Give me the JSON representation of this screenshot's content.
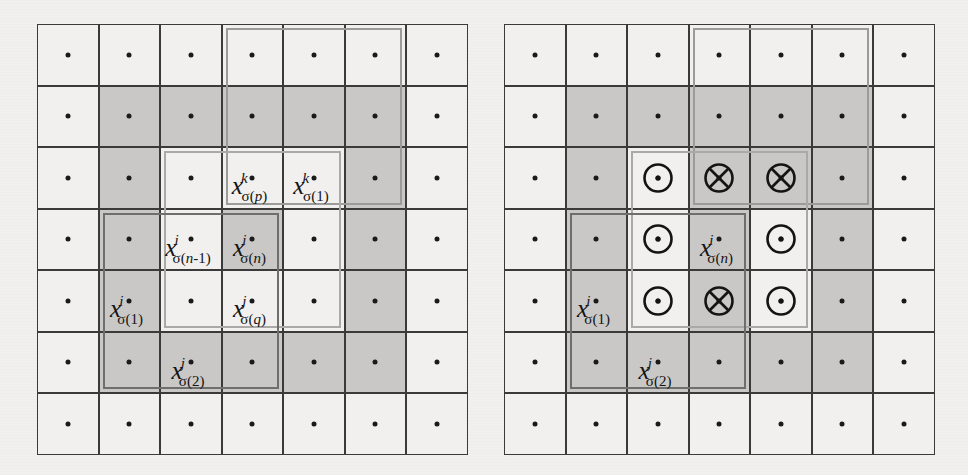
{
  "figure": {
    "grid": {
      "rows": 7,
      "cols": 7,
      "cell_size_px": 61.5
    },
    "colors": {
      "paper": "#f1f0ee",
      "cell_shaded": "#c9c8c6",
      "grid_line": "#3a3a3a",
      "overlay_k": "#9b9b99",
      "overlay_j": "#a9a9a7",
      "overlay_i": "#6e6e6c",
      "ink": "#141414"
    }
  },
  "panels": [
    {
      "id": "left",
      "name": "left-lattice-panel",
      "shaded_cells": [
        [
          2,
          2
        ],
        [
          2,
          3
        ],
        [
          2,
          4
        ],
        [
          2,
          5
        ],
        [
          2,
          6
        ],
        [
          3,
          2
        ],
        [
          3,
          6
        ],
        [
          4,
          2
        ],
        [
          4,
          4
        ],
        [
          4,
          6
        ],
        [
          5,
          2
        ],
        [
          5,
          6
        ],
        [
          6,
          2
        ],
        [
          6,
          3
        ],
        [
          6,
          4
        ],
        [
          6,
          5
        ],
        [
          6,
          6
        ]
      ],
      "overlays": [
        {
          "kind": "k",
          "name": "overlay-rect-k",
          "row_start": 1,
          "row_end": 3,
          "col_start": 4,
          "col_end": 6
        },
        {
          "kind": "j",
          "name": "overlay-rect-j",
          "row_start": 3,
          "row_end": 5,
          "col_start": 3,
          "col_end": 5
        },
        {
          "kind": "i",
          "name": "overlay-rect-i",
          "row_start": 4,
          "row_end": 6,
          "col_start": 2,
          "col_end": 4
        }
      ],
      "labels": [
        {
          "name": "label-x-k-sigma-p",
          "row": 3,
          "col": 4,
          "base": "x",
          "sup": "k",
          "sub_pre": "σ(",
          "sub_var": "p",
          "sub_post": ")"
        },
        {
          "name": "label-x-k-sigma-1",
          "row": 3,
          "col": 5,
          "base": "x",
          "sup": "k",
          "sub_pre": "σ(",
          "sub_var": "",
          "sub_post": "1)"
        },
        {
          "name": "label-x-i-sigma-n-1",
          "row": 4,
          "col": 3,
          "base": "x",
          "sup": "i",
          "sub_pre": "σ(",
          "sub_var": "n",
          "sub_post": "-1)"
        },
        {
          "name": "label-x-i-sigma-n",
          "row": 4,
          "col": 4,
          "base": "x",
          "sup": "i",
          "sub_pre": "σ(",
          "sub_var": "n",
          "sub_post": ")"
        },
        {
          "name": "label-x-i-sigma-1",
          "row": 5,
          "col": 2,
          "base": "x",
          "sup": "i",
          "sub_pre": "σ(",
          "sub_var": "",
          "sub_post": "1)"
        },
        {
          "name": "label-x-j-sigma-q",
          "row": 5,
          "col": 4,
          "base": "x",
          "sup": "j",
          "sub_pre": "σ(",
          "sub_var": "q",
          "sub_post": ")"
        },
        {
          "name": "label-x-i-sigma-2",
          "row": 6,
          "col": 3,
          "base": "x",
          "sup": "j",
          "sub_pre": "σ(",
          "sub_var": "",
          "sub_post": "2)"
        }
      ],
      "symbols": []
    },
    {
      "id": "right",
      "name": "right-lattice-panel",
      "shaded_cells": [
        [
          2,
          2
        ],
        [
          2,
          3
        ],
        [
          2,
          4
        ],
        [
          2,
          5
        ],
        [
          2,
          6
        ],
        [
          3,
          2
        ],
        [
          3,
          4
        ],
        [
          3,
          5
        ],
        [
          3,
          6
        ],
        [
          4,
          2
        ],
        [
          4,
          4
        ],
        [
          4,
          6
        ],
        [
          5,
          2
        ],
        [
          5,
          4
        ],
        [
          5,
          6
        ],
        [
          6,
          2
        ],
        [
          6,
          3
        ],
        [
          6,
          4
        ],
        [
          6,
          5
        ],
        [
          6,
          6
        ]
      ],
      "overlays": [
        {
          "kind": "k",
          "name": "overlay-rect-k",
          "row_start": 1,
          "row_end": 3,
          "col_start": 4,
          "col_end": 6
        },
        {
          "kind": "j",
          "name": "overlay-rect-j",
          "row_start": 3,
          "row_end": 5,
          "col_start": 3,
          "col_end": 5
        },
        {
          "kind": "i",
          "name": "overlay-rect-i",
          "row_start": 4,
          "row_end": 6,
          "col_start": 2,
          "col_end": 4
        }
      ],
      "labels": [
        {
          "name": "label-x-i-sigma-n",
          "row": 4,
          "col": 4,
          "base": "x",
          "sup": "i",
          "sub_pre": "σ(",
          "sub_var": "n",
          "sub_post": ")"
        },
        {
          "name": "label-x-i-sigma-1",
          "row": 5,
          "col": 2,
          "base": "x",
          "sup": "i",
          "sub_pre": "σ(",
          "sub_var": "",
          "sub_post": "1)"
        },
        {
          "name": "label-x-i-sigma-2",
          "row": 6,
          "col": 3,
          "base": "x",
          "sup": "j",
          "sub_pre": "σ(",
          "sub_var": "",
          "sub_post": "2)"
        }
      ],
      "symbols": [
        {
          "name": "circle-dot-icon",
          "glyph": "dot",
          "row": 3,
          "col": 3
        },
        {
          "name": "circle-cross-icon",
          "glyph": "cross",
          "row": 3,
          "col": 4
        },
        {
          "name": "circle-cross-icon",
          "glyph": "cross",
          "row": 3,
          "col": 5
        },
        {
          "name": "circle-dot-icon",
          "glyph": "dot",
          "row": 4,
          "col": 3
        },
        {
          "name": "circle-dot-icon",
          "glyph": "dot",
          "row": 4,
          "col": 5
        },
        {
          "name": "circle-dot-icon",
          "glyph": "dot",
          "row": 5,
          "col": 3
        },
        {
          "name": "circle-cross-icon",
          "glyph": "cross",
          "row": 5,
          "col": 4
        },
        {
          "name": "circle-dot-icon",
          "glyph": "dot",
          "row": 5,
          "col": 5
        }
      ]
    }
  ],
  "legend_note": {
    "circle_dot_meaning": "out-of-plane vector toward viewer",
    "circle_cross_meaning": "out-of-plane vector away from viewer"
  }
}
